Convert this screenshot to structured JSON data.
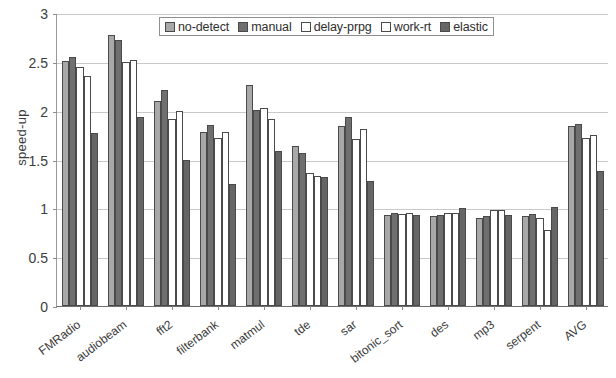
{
  "chart_data": {
    "type": "bar",
    "title": "",
    "xlabel": "",
    "ylabel": "speed-up",
    "ylim": [
      0,
      3
    ],
    "yticks": [
      0,
      0.5,
      1,
      1.5,
      2,
      2.5,
      3
    ],
    "ytick_labels": [
      "0",
      "0.5",
      "1",
      "1.5",
      "2",
      "2.5",
      "3"
    ],
    "grid": true,
    "legend_position": "top-center",
    "categories": [
      "FMRadio",
      "audiobeam",
      "fft2",
      "filterbank",
      "matmul",
      "tde",
      "sar",
      "bitonic_sort",
      "des",
      "mp3",
      "serpent",
      "AVG"
    ],
    "series": [
      {
        "name": "no-detect",
        "color": "#a8a8a8",
        "values": [
          2.51,
          2.77,
          2.1,
          1.78,
          2.26,
          1.64,
          1.84,
          0.93,
          0.92,
          0.9,
          0.92,
          1.84
        ]
      },
      {
        "name": "manual",
        "color": "#6f6f6f",
        "values": [
          2.55,
          2.72,
          2.21,
          1.85,
          2.01,
          1.57,
          1.94,
          0.95,
          0.93,
          0.92,
          0.94,
          1.86
        ]
      },
      {
        "name": "delay-prpg",
        "color": "#ffffff",
        "values": [
          2.45,
          2.5,
          1.91,
          1.72,
          2.03,
          1.36,
          1.71,
          0.94,
          0.95,
          0.98,
          0.9,
          1.72
        ]
      },
      {
        "name": "work-rt",
        "color": "#ffffff",
        "values": [
          2.35,
          2.52,
          2.0,
          1.78,
          1.91,
          1.33,
          1.81,
          0.95,
          0.95,
          0.98,
          0.78,
          1.75
        ]
      },
      {
        "name": "elastic",
        "color": "#666666",
        "values": [
          1.77,
          1.94,
          1.49,
          1.25,
          1.59,
          1.32,
          1.28,
          0.93,
          1.0,
          0.93,
          1.01,
          1.38
        ]
      }
    ]
  }
}
